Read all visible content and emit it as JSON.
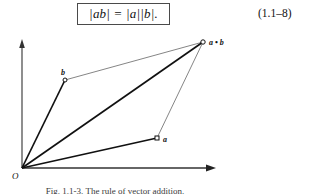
{
  "equation": {
    "formula": "|ab| = |a||b|.",
    "number": "(1.1–8)"
  },
  "figure": {
    "caption": "Fig. 1.1-3. The rule of vector addition.",
    "axes": {
      "vertical_axis_name": "y-axis",
      "horizontal_axis_name": "x-axis",
      "origin_label": "O"
    },
    "points": [
      {
        "id": "origin",
        "label": "O",
        "x": 22,
        "y": 138
      },
      {
        "id": "b",
        "label": "b",
        "x": 65,
        "y": 50
      },
      {
        "id": "a",
        "label": "a",
        "x": 157,
        "y": 108
      },
      {
        "id": "a-plus-b",
        "label": "a • b",
        "x": 203,
        "y": 12
      }
    ],
    "edges": [
      {
        "from": "origin",
        "to": "b",
        "weight": "thick"
      },
      {
        "from": "origin",
        "to": "a",
        "weight": "thick"
      },
      {
        "from": "origin",
        "to": "a-plus-b",
        "weight": "thick"
      },
      {
        "from": "b",
        "to": "a-plus-b",
        "weight": "thin"
      },
      {
        "from": "a",
        "to": "a-plus-b",
        "weight": "thin"
      }
    ]
  },
  "colors": {
    "ink": "#111111",
    "rule": "#4a4a4a",
    "thin_line": "#555555",
    "page": "#ffffff"
  }
}
